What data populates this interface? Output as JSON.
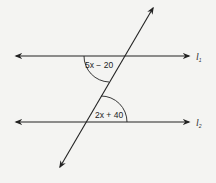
{
  "diagram": {
    "type": "parallel-lines-transversal",
    "lines": [
      {
        "name": "l",
        "subscript": "1",
        "y": 56
      },
      {
        "name": "l",
        "subscript": "2",
        "y": 122
      }
    ],
    "angles": [
      {
        "label": "5x − 20",
        "at_line": "l1",
        "position": "below-left of intersection"
      },
      {
        "label": "2x + 40",
        "at_line": "l2",
        "position": "above-right of intersection"
      }
    ],
    "colors": {
      "line": "#222222",
      "background": "#f4f4f2"
    }
  }
}
